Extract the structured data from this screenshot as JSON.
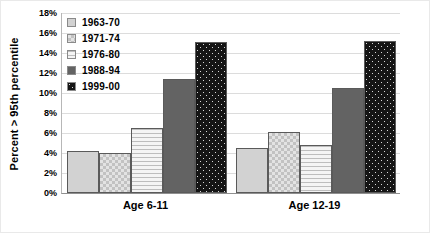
{
  "chart_data": {
    "type": "bar",
    "title": "",
    "xlabel": "",
    "ylabel": "Percent > 95th percentile",
    "ylim": [
      0,
      18
    ],
    "ytick_labels": [
      "18%",
      "16%",
      "14%",
      "12%",
      "10%",
      "8%",
      "6%",
      "4%",
      "2%",
      "0%"
    ],
    "ytick_values": [
      18,
      16,
      14,
      12,
      10,
      8,
      6,
      4,
      2,
      0
    ],
    "grid": true,
    "legend_position": "upper-left-inside",
    "categories": [
      "Age 6-11",
      "Age 12-19"
    ],
    "series": [
      {
        "name": "1963-70",
        "values": [
          4.2,
          4.5
        ],
        "pattern": "solid-light",
        "color": "#d2d2d2"
      },
      {
        "name": "1971-74",
        "values": [
          4.0,
          6.1
        ],
        "pattern": "checker",
        "color": "#c2c2c2"
      },
      {
        "name": "1976-80",
        "values": [
          6.5,
          4.8
        ],
        "pattern": "hlines",
        "color": "#ececec"
      },
      {
        "name": "1988-94",
        "values": [
          11.4,
          10.5
        ],
        "pattern": "solid-dark",
        "color": "#636363"
      },
      {
        "name": "1999-00",
        "values": [
          15.1,
          15.2
        ],
        "pattern": "dots-dark",
        "color": "#151515"
      }
    ]
  }
}
